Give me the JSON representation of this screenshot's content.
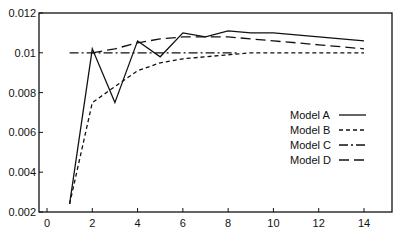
{
  "chart_data": {
    "type": "line",
    "title": "",
    "xlabel": "",
    "ylabel": "",
    "xlim": [
      0,
      15
    ],
    "ylim": [
      0.002,
      0.012
    ],
    "grid": false,
    "legend_position": "right-center inside",
    "x_ticks": [
      0,
      2,
      4,
      6,
      8,
      10,
      12,
      14
    ],
    "x_tick_labels": [
      "0",
      "2",
      "4",
      "6",
      "8",
      "10",
      "12",
      "14"
    ],
    "y_ticks": [
      0.002,
      0.004,
      0.006,
      0.008,
      0.01,
      0.012
    ],
    "y_tick_labels": [
      "0.002",
      "0.004",
      "0.006",
      "0.008",
      "0.01",
      "0.012"
    ],
    "series": [
      {
        "name": "Model A",
        "style": "solid",
        "x": [
          1,
          2,
          3,
          4,
          5,
          6,
          7,
          8,
          9,
          10,
          11,
          12,
          13,
          14
        ],
        "values": [
          0.0024,
          0.0102,
          0.0075,
          0.0106,
          0.0098,
          0.011,
          0.0108,
          0.0111,
          0.011,
          0.011,
          0.0109,
          0.0108,
          0.0107,
          0.0106
        ]
      },
      {
        "name": "Model B",
        "style": "short-dash",
        "x": [
          1,
          2,
          3,
          4,
          5,
          6,
          7,
          8,
          9,
          10,
          11,
          12,
          13,
          14
        ],
        "values": [
          0.0024,
          0.0075,
          0.0083,
          0.0091,
          0.0095,
          0.0097,
          0.0098,
          0.0099,
          0.01,
          0.01,
          0.01,
          0.01,
          0.01,
          0.01
        ]
      },
      {
        "name": "Model C",
        "style": "dash-dot",
        "x": [
          1,
          8.5
        ],
        "values": [
          0.01,
          0.01
        ]
      },
      {
        "name": "Model D",
        "style": "long-dash",
        "x": [
          2,
          3,
          4,
          5,
          6,
          7,
          8,
          9,
          10,
          11,
          12,
          13,
          14
        ],
        "values": [
          0.01,
          0.0102,
          0.0105,
          0.0107,
          0.0108,
          0.0108,
          0.0108,
          0.0107,
          0.0106,
          0.0105,
          0.0104,
          0.0103,
          0.0102
        ]
      }
    ]
  },
  "legend": {
    "items": [
      {
        "label": "Model A",
        "style": "solid"
      },
      {
        "label": "Model B",
        "style": "short-dash"
      },
      {
        "label": "Model C",
        "style": "dash-dot"
      },
      {
        "label": "Model D",
        "style": "long-dash"
      }
    ]
  },
  "colors": {
    "line": "#111111",
    "background": "#ffffff"
  }
}
